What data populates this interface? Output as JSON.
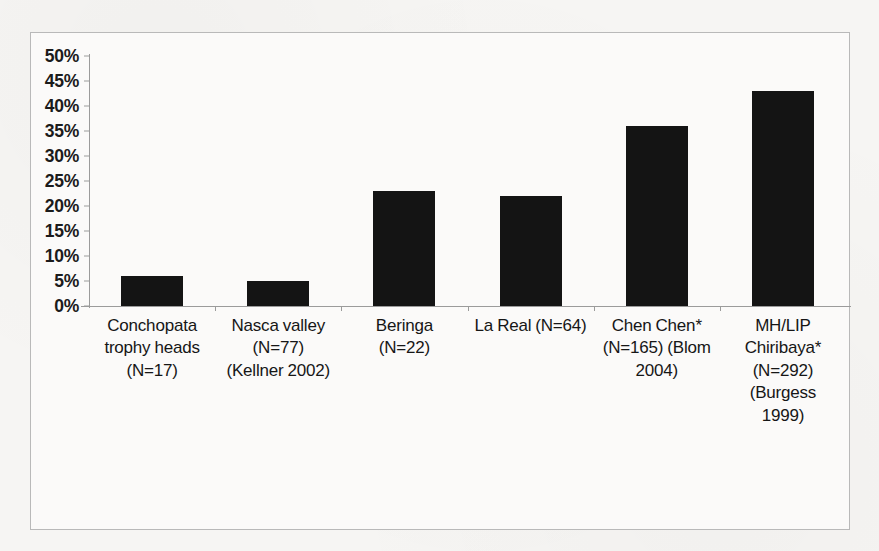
{
  "chart_data": {
    "type": "bar",
    "title": "",
    "subtitle": "",
    "xlabel": "",
    "ylabel": "",
    "ylim": [
      0,
      50
    ],
    "y_tick_labels": [
      "50%",
      "45%",
      "40%",
      "35%",
      "30%",
      "25%",
      "20%",
      "15%",
      "10%",
      "5%",
      "0%"
    ],
    "y_tick_values": [
      50,
      45,
      40,
      35,
      30,
      25,
      20,
      15,
      10,
      5,
      0
    ],
    "grid": false,
    "legend": false,
    "legend_position": "none",
    "bar_color": "#141414",
    "categories": [
      "Conchopata trophy heads (N=17)",
      "Nasca valley (N=77) (Kellner 2002)",
      "Beringa (N=22)",
      "La Real (N=64)",
      "Chen Chen* (N=165) (Blom 2004)",
      "MH/LIP Chiribaya* (N=292) (Burgess 1999)"
    ],
    "category_lines": [
      [
        "Conchopata",
        "trophy heads",
        "(N=17)"
      ],
      [
        "Nasca valley",
        "(N=77)",
        "(Kellner 2002)"
      ],
      [
        "Beringa",
        "(N=22)"
      ],
      [
        "La Real (N=64)"
      ],
      [
        "Chen Chen*",
        "(N=165) (Blom",
        "2004)"
      ],
      [
        "MH/LIP",
        "Chiribaya*",
        "(N=292)",
        "(Burgess",
        "1999)"
      ]
    ],
    "values": [
      6,
      5,
      23,
      22,
      36,
      43
    ]
  },
  "colors": {
    "bar": "#141414",
    "axis": "#9b9b9b",
    "frame": "#b9b9b9",
    "page_background": "#f6f5f3",
    "plot_background": "#fbfaf9",
    "text": "#161616"
  }
}
